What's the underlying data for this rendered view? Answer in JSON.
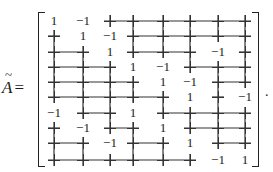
{
  "equation": {
    "lhs_symbol": "A",
    "lhs_accent": "tilde",
    "equals": "=",
    "terminator": "."
  },
  "matrix": {
    "rows": 10,
    "cols": 8,
    "zero_glyph": "+",
    "values": [
      [
        1,
        -1,
        0,
        0,
        0,
        0,
        0,
        0
      ],
      [
        0,
        1,
        -1,
        0,
        0,
        0,
        0,
        0
      ],
      [
        0,
        0,
        1,
        0,
        0,
        0,
        -1,
        0
      ],
      [
        0,
        0,
        0,
        1,
        -1,
        0,
        0,
        0
      ],
      [
        0,
        0,
        0,
        0,
        1,
        -1,
        0,
        0
      ],
      [
        0,
        0,
        0,
        0,
        0,
        1,
        0,
        -1
      ],
      [
        -1,
        0,
        0,
        1,
        0,
        0,
        0,
        0
      ],
      [
        0,
        -1,
        0,
        0,
        1,
        0,
        0,
        0
      ],
      [
        0,
        0,
        -1,
        0,
        0,
        1,
        0,
        0
      ],
      [
        0,
        0,
        0,
        0,
        0,
        0,
        -1,
        1
      ]
    ],
    "col_x": [
      54,
      83,
      110,
      133,
      163,
      190,
      218,
      245
    ],
    "row_y": [
      21,
      36,
      52,
      67,
      82,
      97,
      113,
      128,
      143,
      160
    ]
  }
}
